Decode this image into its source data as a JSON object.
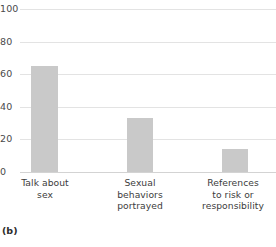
{
  "panel": {
    "label": "(b)"
  },
  "chart_data": {
    "type": "bar",
    "title": "",
    "subtitle": "",
    "xlabel": "",
    "ylabel": "",
    "categories": [
      "Talk about\nsex",
      "Sexual\nbehaviors\nportrayed",
      "References\nto risk or\nresponsibility"
    ],
    "category_lines": [
      [
        "Talk about",
        "sex"
      ],
      [
        "Sexual",
        "behaviors",
        "portrayed"
      ],
      [
        "References",
        "to risk or",
        "responsibility"
      ]
    ],
    "values": [
      65,
      33,
      14
    ],
    "ylim": [
      0,
      100
    ],
    "yticks": [
      0,
      20,
      40,
      60,
      80,
      100
    ],
    "ytick_labels": [
      "0",
      "20",
      "40",
      "60",
      "80",
      "100"
    ],
    "grid": true,
    "grid_axis": "y",
    "legend": false,
    "legend_position": "none",
    "bar_color": "#c9c9c9",
    "grid_color": "#e3e3e3",
    "axis_color": "#d3d3d3",
    "background": "#ffffff"
  }
}
